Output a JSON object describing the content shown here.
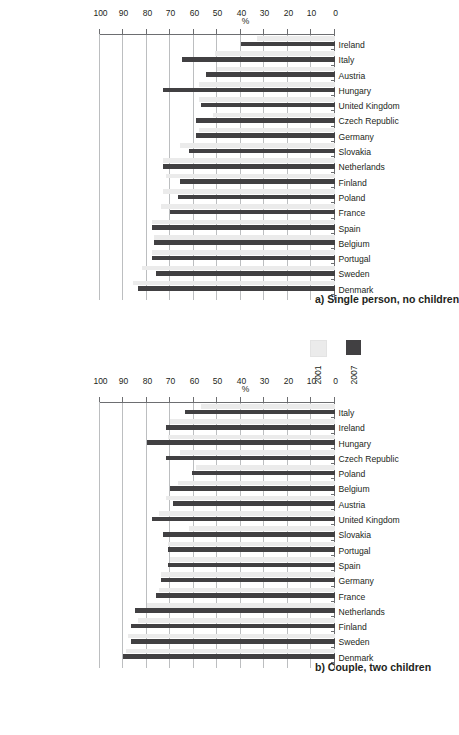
{
  "page": {
    "orientation": "rotated-90",
    "colors": {
      "series_2001": "#ebebeb",
      "series_2007": "#414042",
      "axis": "#6d6e71",
      "grid": "#bcbec0"
    }
  },
  "legend": {
    "items": [
      {
        "label": "2001",
        "color": "#ebebeb"
      },
      {
        "label": "2007",
        "color": "#414042"
      }
    ]
  },
  "chart_data": [
    {
      "id": "chart-a",
      "type": "bar",
      "title": "a) Single person, no children",
      "xlabel": "",
      "ylabel": "%",
      "ylim": [
        0,
        100
      ],
      "yticks": [
        0,
        10,
        20,
        30,
        40,
        50,
        60,
        70,
        80,
        90,
        100
      ],
      "grid": true,
      "legend_position": "bottom-right",
      "categories": [
        "Ireland",
        "Italy",
        "Austria",
        "Hungary",
        "United Kingdom",
        "Czech Republic",
        "Germany",
        "Slovakia",
        "Netherlands",
        "Finland",
        "Poland",
        "France",
        "Spain",
        "Belgium",
        "Portugal",
        "Sweden",
        "Denmark"
      ],
      "series": [
        {
          "name": "2001",
          "values": [
            33,
            51,
            50,
            58,
            58,
            52,
            58,
            66,
            73,
            72,
            73,
            74,
            78,
            77,
            78,
            82,
            86
          ]
        },
        {
          "name": "2007",
          "values": [
            40,
            65,
            55,
            73,
            57,
            59,
            59,
            62,
            73,
            66,
            67,
            70,
            78,
            77,
            78,
            76,
            84
          ]
        }
      ]
    },
    {
      "id": "chart-b",
      "type": "bar",
      "title": "b) Couple, two children",
      "xlabel": "",
      "ylabel": "%",
      "ylim": [
        0,
        100
      ],
      "yticks": [
        0,
        10,
        20,
        30,
        40,
        50,
        60,
        70,
        80,
        90,
        100
      ],
      "grid": true,
      "legend_position": "top-right",
      "categories": [
        "Italy",
        "Ireland",
        "Hungary",
        "Czech Republic",
        "Poland",
        "Belgium",
        "Austria",
        "United Kingdom",
        "Slovakia",
        "Portugal",
        "Spain",
        "Germany",
        "France",
        "Netherlands",
        "Finland",
        "Sweden",
        "Denmark"
      ],
      "series": [
        {
          "name": "2001",
          "values": [
            57,
            70,
            71,
            66,
            59,
            67,
            72,
            75,
            62,
            71,
            70,
            74,
            75,
            80,
            84,
            88,
            89
          ]
        },
        {
          "name": "2007",
          "values": [
            64,
            72,
            80,
            72,
            61,
            70,
            69,
            78,
            73,
            71,
            71,
            74,
            76,
            85,
            87,
            87,
            90
          ]
        }
      ]
    }
  ]
}
